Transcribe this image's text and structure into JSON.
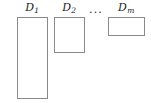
{
  "figure": {
    "background_color": "#ffffff",
    "stroke_color": "#8a8a8a",
    "text_color": "#1a1a1a",
    "ellipsis": "...",
    "items": [
      {
        "label_base": "D",
        "label_sub": "1",
        "label_center_x": 32,
        "label_y": 2,
        "box": {
          "x": 17,
          "y": 17,
          "width": 31,
          "height": 82
        }
      },
      {
        "label_base": "D",
        "label_sub": "2",
        "label_center_x": 69,
        "label_y": 2,
        "box": {
          "x": 54,
          "y": 17,
          "width": 31,
          "height": 36
        }
      },
      {
        "label_base": "D",
        "label_sub": "m",
        "label_center_x": 126,
        "label_y": 2,
        "box": {
          "x": 108,
          "y": 17,
          "width": 37,
          "height": 19
        }
      }
    ],
    "ellipsis_center_x": 96,
    "ellipsis_y": 4
  }
}
